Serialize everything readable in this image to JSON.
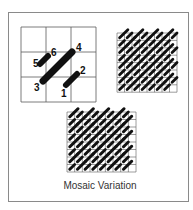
{
  "caption": "Mosaic Variation",
  "colors": {
    "line": "#5a5a5a",
    "stitch": "#111111",
    "frame": "#8a8a8a",
    "text": "#333333"
  },
  "diagram": {
    "stitch_guide": {
      "grid": {
        "cols": 3,
        "rows": 3,
        "x": 21,
        "y": 27,
        "cell": 25
      },
      "stitches": [
        {
          "from_label": "1",
          "to_label": "2",
          "x1": 66,
          "y1": 85,
          "x2": 77,
          "y2": 74,
          "weight": 6
        },
        {
          "from_label": "3",
          "to_label": "4",
          "x1": 43,
          "y1": 81,
          "x2": 72,
          "y2": 52,
          "weight": 7
        },
        {
          "from_label": "5",
          "to_label": "6",
          "x1": 40,
          "y1": 64,
          "x2": 48,
          "y2": 56,
          "weight": 6
        }
      ],
      "labels": [
        {
          "text": "1",
          "x": 61,
          "y": 97
        },
        {
          "text": "2",
          "x": 80,
          "y": 74
        },
        {
          "text": "3",
          "x": 34,
          "y": 91
        },
        {
          "text": "4",
          "x": 76,
          "y": 51
        },
        {
          "text": "5",
          "x": 33,
          "y": 67
        },
        {
          "text": "6",
          "x": 51,
          "y": 56
        }
      ]
    },
    "pattern_small": {
      "cols": 8,
      "rows": 8,
      "x": 117,
      "y": 33,
      "cw": 7.5,
      "ch": 7.4
    },
    "pattern_large": {
      "cols": 9,
      "rows": 8,
      "x": 67,
      "y": 112,
      "cw": 7.67,
      "ch": 7.5
    }
  }
}
